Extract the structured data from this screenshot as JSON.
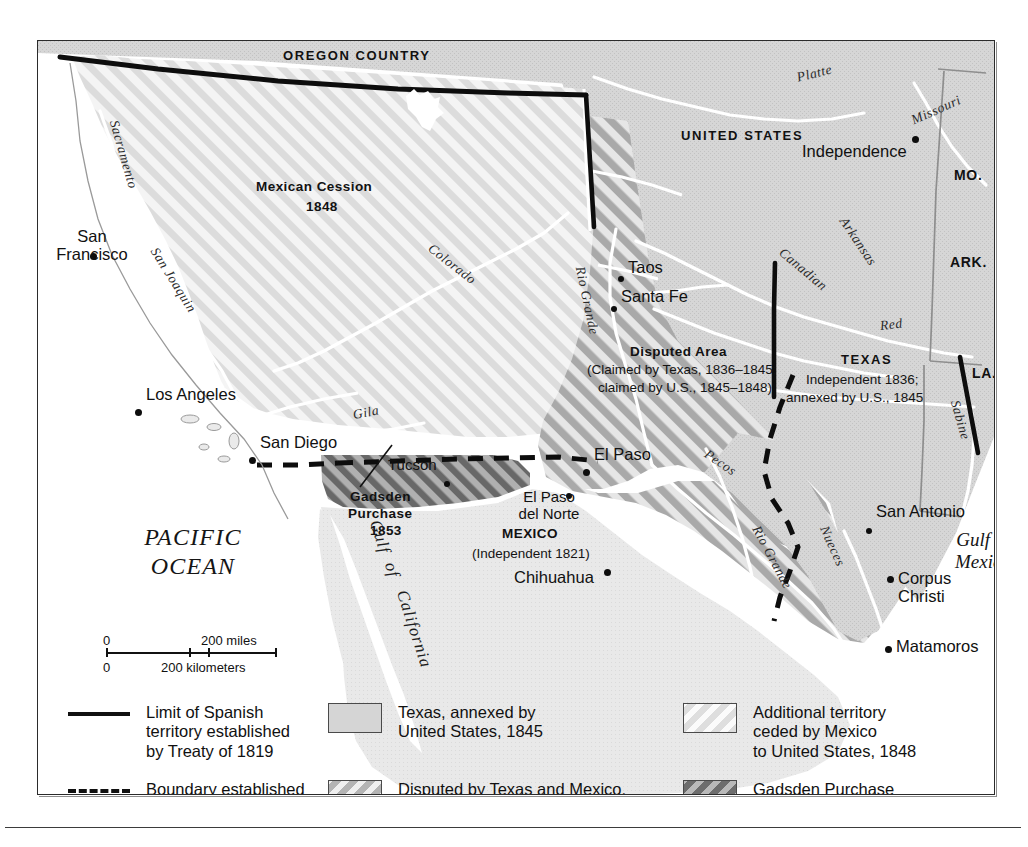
{
  "map": {
    "title_regions": {
      "oregon_country": "OREGON COUNTRY",
      "united_states": "UNITED STATES",
      "mexican_cession_line1": "Mexican Cession",
      "mexican_cession_line2": "1848",
      "disputed_title": "Disputed Area",
      "disputed_line1": "(Claimed by Texas, 1836–1845;",
      "disputed_line2": "claimed by U.S., 1845–1848)",
      "texas_title": "TEXAS",
      "texas_line1": "Independent 1836;",
      "texas_line2": "annexed by U.S., 1845",
      "mexico_title": "MEXICO",
      "mexico_line1": "(Independent 1821)",
      "gadsden_line1": "Gadsden",
      "gadsden_line2": "Purchase",
      "gadsden_line3": "1853"
    },
    "states": [
      {
        "label": "MO."
      },
      {
        "label": "ARK."
      },
      {
        "label": "LA."
      }
    ],
    "water_labels": {
      "pacific_line1": "PACIFIC",
      "pacific_line2": "OCEAN",
      "gulf_mexico_line1": "Gulf of",
      "gulf_mexico_line2": "Mexico",
      "gulf_california_1": "Gulf",
      "gulf_california_2": "of",
      "gulf_california_3": "California"
    },
    "rivers": [
      {
        "name": "Sacramento"
      },
      {
        "name": "San Joaquin"
      },
      {
        "name": "Colorado"
      },
      {
        "name": "Gila"
      },
      {
        "name": "Rio Grande"
      },
      {
        "name": "Platte"
      },
      {
        "name": "Missouri"
      },
      {
        "name": "Arkansas"
      },
      {
        "name": "Canadian"
      },
      {
        "name": "Red"
      },
      {
        "name": "Pecos"
      },
      {
        "name": "Sabine"
      },
      {
        "name": "Nueces"
      },
      {
        "name": "Rio Grande"
      }
    ],
    "cities": [
      {
        "name": "San\nFrancisco"
      },
      {
        "name": "Los Angeles"
      },
      {
        "name": "San Diego"
      },
      {
        "name": "Tucson"
      },
      {
        "name": "El Paso"
      },
      {
        "name": "El Paso\ndel Norte"
      },
      {
        "name": "Chihuahua"
      },
      {
        "name": "Taos"
      },
      {
        "name": "Santa Fe"
      },
      {
        "name": "Independence"
      },
      {
        "name": "San Antonio"
      },
      {
        "name": "Corpus\nChristi"
      },
      {
        "name": "Matamoros"
      }
    ]
  },
  "scale": {
    "miles_zero": "0",
    "miles_value": "200 miles",
    "km_zero": "0",
    "km_value": "200 kilometers"
  },
  "legend": {
    "items": [
      {
        "mark": "solid-line",
        "text": "Limit of Spanish\nterritory established\nby Treaty of 1819"
      },
      {
        "mark": "dashed-line",
        "text": "Boundary established\nby Treaty of Guadalupe\nHidalgo, 1848"
      },
      {
        "mark": "swatch-solid",
        "text": "Texas, annexed by\nUnited States, 1845"
      },
      {
        "mark": "swatch-disputed",
        "text": "Disputed by Texas and Mexico,\nlater by United States and Mexico;\nceded by Mexico, 1848"
      },
      {
        "mark": "swatch-ceded",
        "text": "Additional territory\nceded by Mexico\nto United States, 1848"
      },
      {
        "mark": "swatch-gadsden",
        "text": "Gadsden Purchase\nby United States\nfrom Mexico, 1853"
      }
    ]
  },
  "colors": {
    "land_us": "#d4d4d4",
    "land_mexico": "#e8e8e8",
    "cession_light": "#ededed",
    "cession_stripe": "#dcdcdc",
    "disputed_dark": "#b0b0b0",
    "disputed_light": "#e9e9e9",
    "gadsden_dark": "#6a6a6a",
    "gadsden_light": "#b5b5b5",
    "water": "#ffffff",
    "border_ink": "#111111",
    "frame": "#2b2b2b"
  }
}
